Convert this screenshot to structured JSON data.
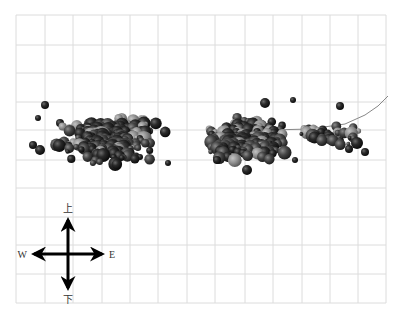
{
  "chart_data": {
    "type": "scatter",
    "title": "",
    "xlabel": "",
    "ylabel": "",
    "grid": {
      "on": true,
      "x_lines": [
        16,
        45,
        73,
        102,
        130,
        158,
        187,
        215,
        245,
        273,
        302,
        330,
        358,
        386
      ],
      "y_lines": [
        15,
        45,
        73,
        102,
        130,
        160,
        188,
        217,
        245,
        274,
        303
      ],
      "color": "#dcdcdc"
    },
    "compass": {
      "center": [
        68,
        254
      ],
      "arm": 38,
      "labels": {
        "up": "上",
        "down": "下",
        "left": "W",
        "right": "E"
      }
    },
    "trend_curve": {
      "description": "thin gray curve rising toward upper right",
      "points": [
        [
          270,
          130
        ],
        [
          310,
          129
        ],
        [
          345,
          124
        ],
        [
          365,
          115
        ],
        [
          378,
          106
        ],
        [
          388,
          96
        ]
      ]
    },
    "clusters": [
      {
        "name": "west-cluster",
        "cx": 110,
        "cy": 140,
        "rx": 60,
        "ry": 30,
        "count": 260,
        "x_range": [
          28,
          185
        ],
        "y_range": [
          98,
          182
        ]
      },
      {
        "name": "east-cluster",
        "cx": 245,
        "cy": 140,
        "rx": 55,
        "ry": 25,
        "count": 210,
        "x_range": [
          185,
          300
        ],
        "y_range": [
          102,
          172
        ]
      },
      {
        "name": "east-tail",
        "cx": 330,
        "cy": 135,
        "rx": 35,
        "ry": 15,
        "count": 35,
        "x_range": [
          300,
          365
        ],
        "y_range": [
          105,
          160
        ]
      }
    ],
    "outliers": [
      [
        45,
        105,
        4
      ],
      [
        60,
        123,
        4
      ],
      [
        33,
        145,
        4
      ],
      [
        40,
        150,
        5
      ],
      [
        38,
        118,
        3
      ],
      [
        340,
        106,
        4
      ],
      [
        357,
        143,
        6
      ],
      [
        365,
        152,
        4
      ],
      [
        349,
        149,
        4
      ],
      [
        265,
        103,
        5
      ],
      [
        293,
        100,
        3
      ],
      [
        217,
        160,
        4
      ],
      [
        247,
        170,
        5
      ],
      [
        295,
        160,
        3
      ],
      [
        140,
        157,
        3
      ],
      [
        168,
        163,
        3
      ]
    ]
  },
  "colors": {
    "background": "#ffffff",
    "grid": "#dcdcdc",
    "sphere_dark": "#1a1a1a",
    "sphere_mid": "#3a3a3a",
    "sphere_light": "#8a8a8a",
    "axis_arrow": "#000000",
    "curve": "#888888"
  }
}
